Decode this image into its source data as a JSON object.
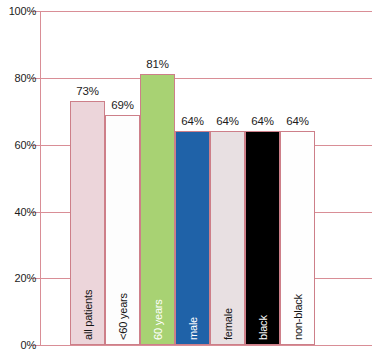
{
  "chart_data": {
    "type": "bar",
    "title": "",
    "xlabel": "",
    "ylabel": "",
    "ylim": [
      0,
      100
    ],
    "grid": true,
    "legend": "none",
    "categories": [
      "all patients",
      "<60 years",
      "60 years",
      "male",
      "female",
      "black",
      "non-black"
    ],
    "values": [
      73,
      69,
      81,
      64,
      64,
      64,
      64
    ],
    "value_labels": [
      "73%",
      "69%",
      "81%",
      "64%",
      "64%",
      "64%",
      "64%"
    ],
    "ytick_labels": [
      "0%",
      "20%",
      "40%",
      "60%",
      "80%",
      "100%"
    ],
    "ytick_values": [
      0,
      20,
      40,
      60,
      80,
      100
    ],
    "bar_colors": [
      "#ecd5da",
      "#fdfdfd",
      "#a8d273",
      "#1f62a8",
      "#e8e0e2",
      "#000000",
      "#fefefe"
    ],
    "bar_label_colors": [
      "#141414",
      "#141414",
      "#ffffff",
      "#ffffff",
      "#141414",
      "#ffffff",
      "#141414"
    ],
    "bar_border_color": "#cd7f89",
    "gridline_color": "#d98e96",
    "axis_color": "#d98e96",
    "value_label_color": "#1c1c1c"
  }
}
